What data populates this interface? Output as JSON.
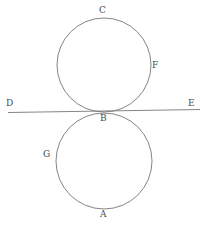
{
  "figure": {
    "width": 206,
    "height": 228,
    "background_color": "#ffffff",
    "stroke_color": "#777777",
    "label_color": "#4a4a4a",
    "stroke_width": 0.9
  },
  "shapes": {
    "upper_circle": {
      "name": "upper-circle",
      "cx": 104,
      "cy": 65,
      "r": 47
    },
    "lower_circle": {
      "name": "lower-circle",
      "cx": 104,
      "cy": 161,
      "r": 48
    },
    "tangent_line": {
      "name": "tangent-line-DE",
      "x1": 8,
      "y1": 112.5,
      "x2": 200,
      "y2": 109.5
    }
  },
  "labels": {
    "C": "C",
    "F": "F",
    "D": "D",
    "E": "E",
    "B": "B",
    "G": "G",
    "A": "A"
  }
}
